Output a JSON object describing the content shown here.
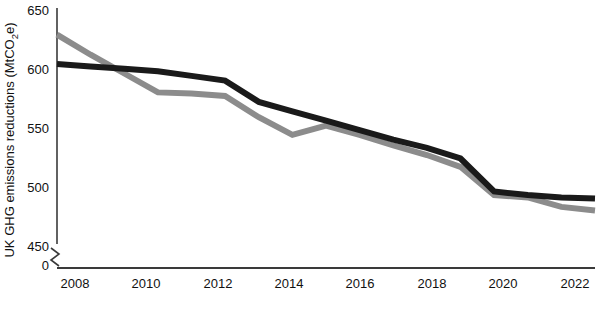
{
  "chart_data": {
    "type": "line",
    "title": "",
    "xlabel": "",
    "ylabel": "UK GHG emissions reductions (MtCO2e)",
    "ylabel_parts": {
      "before": "UK GHG emissions reductions (MtCO",
      "subscript": "2",
      "after": "e)"
    },
    "ylim": [
      450,
      650
    ],
    "y_axis_break": true,
    "y_break_baseline": 0,
    "xlim": [
      2007,
      2023
    ],
    "grid": false,
    "legend": "none",
    "y_ticks": [
      "650",
      "600",
      "550",
      "500",
      "450",
      "0"
    ],
    "y_tick_values": [
      650,
      600,
      550,
      500,
      450,
      0
    ],
    "x_ticks": [
      "2008",
      "2010",
      "2012",
      "2014",
      "2016",
      "2018",
      "2020",
      "2022"
    ],
    "x_tick_values": [
      2008,
      2010,
      2012,
      2014,
      2016,
      2018,
      2020,
      2022
    ],
    "series": [
      {
        "name": "black-line",
        "color": "#1a1a1a",
        "x": [
          2007,
          2008,
          2009,
          2010,
          2011,
          2012,
          2013,
          2014,
          2015,
          2016,
          2017,
          2018,
          2019,
          2020,
          2021,
          2022,
          2023
        ],
        "values": [
          605,
          603,
          601,
          599,
          595,
          591,
          573,
          565,
          557,
          549,
          541,
          534,
          525,
          497,
          494,
          492,
          491
        ]
      },
      {
        "name": "grey-line",
        "color": "#8c8c8c",
        "x": [
          2007,
          2008,
          2009,
          2010,
          2011,
          2012,
          2013,
          2014,
          2015,
          2016,
          2017,
          2018,
          2019,
          2020,
          2021,
          2022,
          2023
        ],
        "values": [
          630,
          613,
          597,
          581,
          580,
          578,
          560,
          545,
          553,
          545,
          536,
          528,
          518,
          494,
          492,
          484,
          481
        ]
      }
    ]
  },
  "colors": {
    "black_series": "#1a1a1a",
    "grey_series": "#8c8c8c",
    "axis": "#3a3a3a",
    "text": "#111111",
    "background": "#ffffff"
  }
}
